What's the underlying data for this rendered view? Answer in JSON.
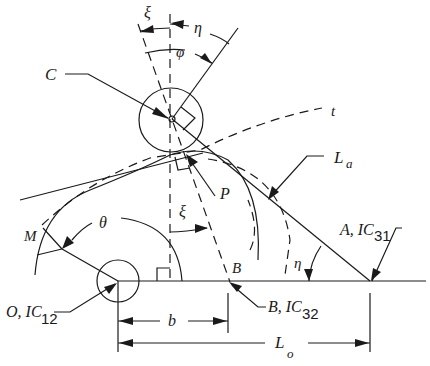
{
  "figure": {
    "type": "mechanism-geometry-diagram",
    "labels": {
      "xi_top": "ξ",
      "eta_top": "η",
      "phi": "φ",
      "C": "C",
      "t": "t",
      "La_main": "L",
      "La_sub": "a",
      "P": "P",
      "M": "M",
      "theta": "θ",
      "xi_mid": "ξ",
      "B": "B",
      "eta_bottom": "η",
      "A_main": "A, IC",
      "A_sub": "31",
      "O_main": "O, IC",
      "O_sub": "12",
      "B_ic_main": "B, IC",
      "B_ic_sub": "32",
      "b": "b",
      "Lo_main": "L",
      "Lo_sub": "o"
    },
    "points": {
      "O": [
        118,
        281
      ],
      "B": [
        228,
        281
      ],
      "A": [
        370,
        281
      ],
      "C": [
        171,
        120
      ]
    },
    "colors": {
      "ink": "#1a1a1a",
      "background": "#ffffff"
    }
  }
}
